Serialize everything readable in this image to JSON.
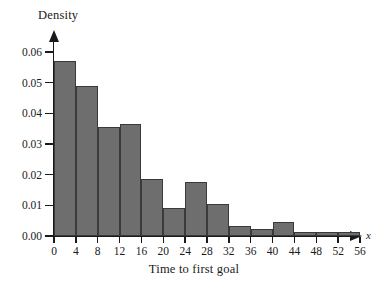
{
  "chart_data": {
    "type": "bar",
    "title": "",
    "xlabel": "Time to first goal",
    "ylabel": "Density",
    "x_variable_symbol": "x",
    "bin_width": 4,
    "xlim": [
      0,
      56
    ],
    "ylim": [
      0.0,
      0.06
    ],
    "grid": false,
    "legend": null,
    "bar_fill_color": "#6e6e6e",
    "bar_edge_color": "#3a3a3a",
    "axis_color": "#1a1a1a",
    "x_ticks": [
      0,
      4,
      8,
      12,
      16,
      20,
      24,
      28,
      32,
      36,
      40,
      44,
      48,
      52,
      56
    ],
    "x_tick_labels": [
      "0",
      "4",
      "8",
      "12",
      "16",
      "20",
      "24",
      "28",
      "32",
      "36",
      "40",
      "44",
      "48",
      "52",
      "56"
    ],
    "y_ticks": [
      0.0,
      0.01,
      0.02,
      0.03,
      0.04,
      0.05,
      0.06
    ],
    "y_tick_labels": [
      "0.00",
      "0.01",
      "0.02",
      "0.03",
      "0.04",
      "0.05",
      "0.06"
    ],
    "bins": [
      {
        "label": "0-4",
        "start": 0,
        "end": 4,
        "density": 0.057
      },
      {
        "label": "4-8",
        "start": 4,
        "end": 8,
        "density": 0.049
      },
      {
        "label": "8-12",
        "start": 8,
        "end": 12,
        "density": 0.0357
      },
      {
        "label": "12-16",
        "start": 12,
        "end": 16,
        "density": 0.0365
      },
      {
        "label": "16-20",
        "start": 16,
        "end": 20,
        "density": 0.0186
      },
      {
        "label": "20-24",
        "start": 20,
        "end": 24,
        "density": 0.0091
      },
      {
        "label": "24-28",
        "start": 24,
        "end": 28,
        "density": 0.0177
      },
      {
        "label": "28-32",
        "start": 28,
        "end": 32,
        "density": 0.0103
      },
      {
        "label": "32-36",
        "start": 32,
        "end": 36,
        "density": 0.0034
      },
      {
        "label": "36-40",
        "start": 36,
        "end": 40,
        "density": 0.0023
      },
      {
        "label": "40-44",
        "start": 40,
        "end": 44,
        "density": 0.0045
      },
      {
        "label": "44-48",
        "start": 44,
        "end": 48,
        "density": 0.0014
      },
      {
        "label": "48-52",
        "start": 48,
        "end": 52,
        "density": 0.0014
      },
      {
        "label": "52-56",
        "start": 52,
        "end": 56,
        "density": 0.0014
      }
    ],
    "categories": [
      "0-4",
      "4-8",
      "8-12",
      "12-16",
      "16-20",
      "20-24",
      "24-28",
      "28-32",
      "32-36",
      "36-40",
      "40-44",
      "44-48",
      "48-52",
      "52-56"
    ],
    "values": [
      0.057,
      0.049,
      0.0357,
      0.0365,
      0.0186,
      0.0091,
      0.0177,
      0.0103,
      0.0034,
      0.0023,
      0.0045,
      0.0014,
      0.0014,
      0.0014
    ]
  }
}
